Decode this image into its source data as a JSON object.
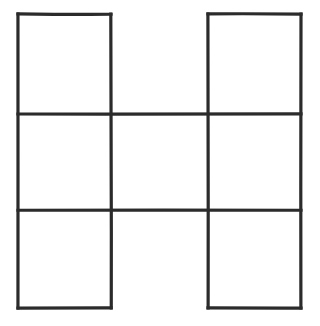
{
  "figure": {
    "description": "Line drawing of a 3 by 3 square grid with the top-middle and bottom-middle cells left open, forming an H / I shape.",
    "canvas": {
      "width": 320,
      "height": 326
    },
    "style": {
      "background_color": "#ffffff",
      "line_color": "#2b2b2b",
      "line_width": 3.2
    },
    "geometry": {
      "vertical_positions": [
        18,
        111,
        208,
        301
      ],
      "horizontal_positions": [
        14,
        114,
        210,
        308
      ],
      "column_labels": [
        "left",
        "middle",
        "right"
      ],
      "row_labels": [
        "top",
        "middle",
        "bottom"
      ],
      "cells_filled": [
        {
          "row": "top",
          "column": "left",
          "closed": true
        },
        {
          "row": "top",
          "column": "middle",
          "closed": false
        },
        {
          "row": "top",
          "column": "right",
          "closed": true
        },
        {
          "row": "middle",
          "column": "left",
          "closed": true
        },
        {
          "row": "middle",
          "column": "middle",
          "closed": true
        },
        {
          "row": "middle",
          "column": "right",
          "closed": true
        },
        {
          "row": "bottom",
          "column": "left",
          "closed": true
        },
        {
          "row": "bottom",
          "column": "middle",
          "closed": false
        },
        {
          "row": "bottom",
          "column": "right",
          "closed": true
        }
      ]
    },
    "segments": [
      {
        "name": "top-edge-left-square",
        "orientation": "horizontal",
        "x1": 18,
        "y1": 14,
        "x2": 111,
        "y2": 14
      },
      {
        "name": "top-edge-right-square",
        "orientation": "horizontal",
        "x1": 208,
        "y1": 14,
        "x2": 301,
        "y2": 14
      },
      {
        "name": "upper-middle-rule",
        "orientation": "horizontal",
        "x1": 18,
        "y1": 114,
        "x2": 301,
        "y2": 114
      },
      {
        "name": "lower-middle-rule",
        "orientation": "horizontal",
        "x1": 18,
        "y1": 210,
        "x2": 301,
        "y2": 210
      },
      {
        "name": "bottom-edge-left-square",
        "orientation": "horizontal",
        "x1": 18,
        "y1": 308,
        "x2": 111,
        "y2": 308
      },
      {
        "name": "bottom-edge-right-square",
        "orientation": "horizontal",
        "x1": 208,
        "y1": 308,
        "x2": 301,
        "y2": 308
      },
      {
        "name": "left-outer-vertical",
        "orientation": "vertical",
        "x1": 18,
        "y1": 14,
        "x2": 18,
        "y2": 308
      },
      {
        "name": "inner-left-vertical",
        "orientation": "vertical",
        "x1": 111,
        "y1": 14,
        "x2": 111,
        "y2": 308
      },
      {
        "name": "inner-right-vertical",
        "orientation": "vertical",
        "x1": 208,
        "y1": 14,
        "x2": 208,
        "y2": 308
      },
      {
        "name": "right-outer-vertical",
        "orientation": "vertical",
        "x1": 301,
        "y1": 14,
        "x2": 301,
        "y2": 308
      }
    ]
  }
}
